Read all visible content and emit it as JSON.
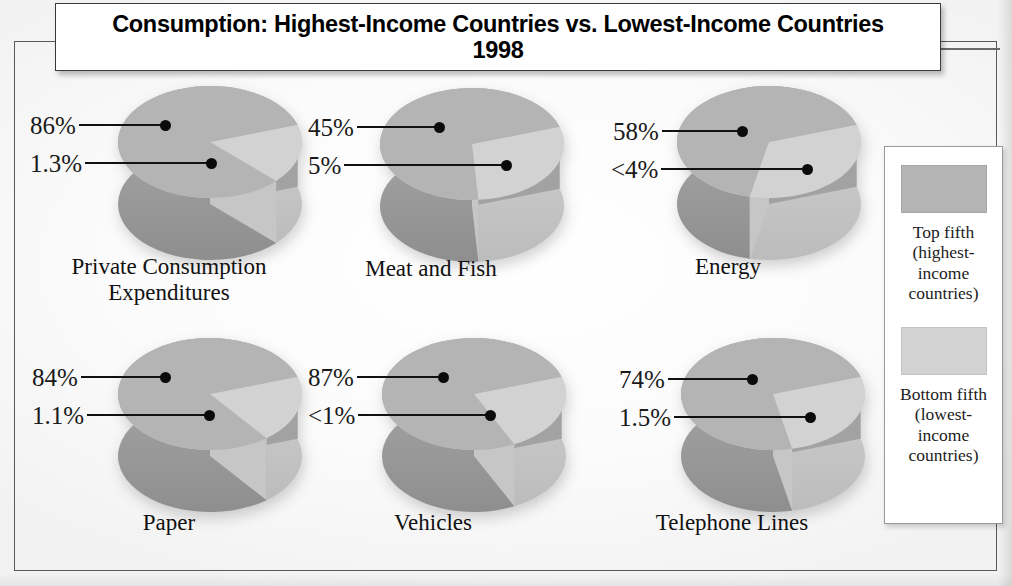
{
  "title": {
    "line1": "Consumption: Highest-Income Countries vs. Lowest-Income Countries",
    "line2": "1998"
  },
  "colors": {
    "top_fifth": "#b4b4b4",
    "bottom_fifth": "#d2d2d2",
    "top_fifth_side": "#9a9a9a",
    "bottom_fifth_side": "#c0c0c0",
    "leader_line": "#111111",
    "frame": "#5a5a5a"
  },
  "legend": {
    "items": [
      {
        "swatch_color": "#b4b4b4",
        "label": "Top fifth\n(highest-\nincome\ncountries)"
      },
      {
        "swatch_color": "#d2d2d2",
        "label": "Bottom fifth\n(lowest-\nincome\ncountries)"
      }
    ]
  },
  "chart_data": {
    "type": "pie",
    "title": "Consumption: Highest-Income Countries vs. Lowest-Income Countries 1998",
    "series_names": [
      "Top fifth (highest-income countries)",
      "Bottom fifth (lowest-income countries)"
    ],
    "legend_position": "right",
    "unit": "percent",
    "charts": [
      {
        "category": "Private Consumption Expenditures",
        "caption_line1": "Private Consumption",
        "caption_line2": "Expenditures",
        "top_label": "86%",
        "bottom_label": "1.3%",
        "top_value": 86,
        "bottom_value": 1.3
      },
      {
        "category": "Meat and Fish",
        "caption_line1": "Meat and Fish",
        "caption_line2": "",
        "top_label": "45%",
        "bottom_label": "5%",
        "top_value": 45,
        "bottom_value": 5
      },
      {
        "category": "Energy",
        "caption_line1": "Energy",
        "caption_line2": "",
        "top_label": "58%",
        "bottom_label": "<4%",
        "top_value": 58,
        "bottom_value": 4
      },
      {
        "category": "Paper",
        "caption_line1": "Paper",
        "caption_line2": "",
        "top_label": "84%",
        "bottom_label": "1.1%",
        "top_value": 84,
        "bottom_value": 1.1
      },
      {
        "category": "Vehicles",
        "caption_line1": "Vehicles",
        "caption_line2": "",
        "top_label": "87%",
        "bottom_label": "<1%",
        "top_value": 87,
        "bottom_value": 1
      },
      {
        "category": "Telephone Lines",
        "caption_line1": "Telephone Lines",
        "caption_line2": "",
        "top_label": "74%",
        "bottom_label": "1.5%",
        "top_value": 74,
        "bottom_value": 1.5
      }
    ]
  }
}
